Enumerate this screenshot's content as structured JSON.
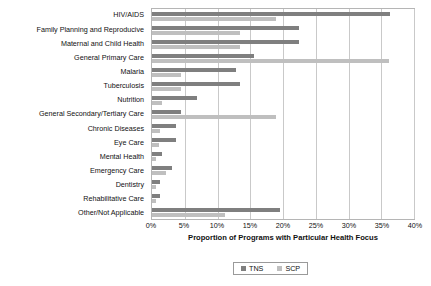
{
  "chart_data": {
    "type": "bar",
    "orientation": "horizontal",
    "title": "",
    "xlabel": "Proportion of Programs with Particular Health Focus",
    "ylabel": "",
    "xlim": [
      0,
      40
    ],
    "xtick_labels": [
      "0%",
      "5%",
      "10%",
      "15%",
      "20%",
      "25%",
      "30%",
      "35%",
      "40%"
    ],
    "xtick_values": [
      0,
      5,
      10,
      15,
      20,
      25,
      30,
      35,
      40
    ],
    "grid": true,
    "legend_position": "bottom",
    "categories": [
      "HIV/AIDS",
      "Family Planning and Reproducive",
      "Maternal and Child Health",
      "General Primary Care",
      "Malaria",
      "Tuberculosis",
      "Nutrition",
      "General Secondary/Tertiary Care",
      "Chronic Diseases",
      "Eye Care",
      "Mental Health",
      "Emergency Care",
      "Dentistry",
      "Rehabilitative Care",
      "Other/Not Applicable"
    ],
    "series": [
      {
        "name": "TNS",
        "color": "#7f7f7f",
        "values": [
          36.3,
          22.4,
          22.4,
          15.6,
          12.8,
          13.4,
          6.9,
          4.5,
          3.6,
          3.6,
          1.5,
          3.0,
          1.2,
          1.2,
          19.6
        ]
      },
      {
        "name": "SCP",
        "color": "#bfbfbf",
        "values": [
          19.0,
          13.5,
          13.5,
          36.2,
          4.5,
          4.5,
          1.5,
          19.0,
          1.2,
          1.0,
          0.6,
          2.2,
          0.6,
          0.6,
          11.2
        ]
      }
    ]
  },
  "legend": {
    "items": [
      {
        "label": "TNS",
        "color": "#7f7f7f"
      },
      {
        "label": "SCP",
        "color": "#bfbfbf"
      }
    ]
  }
}
